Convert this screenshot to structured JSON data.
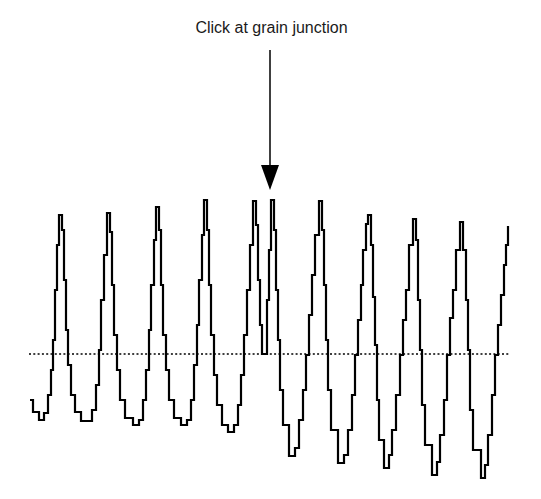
{
  "annotation": {
    "label": "Click at grain junction",
    "arrow": {
      "x": 270,
      "y_start": 50,
      "y_end": 190,
      "head_top": 165
    }
  },
  "colors": {
    "trace": "#000000",
    "baseline": "#000000",
    "text": "#1a1a1a"
  },
  "chart_data": {
    "type": "line",
    "title": "",
    "xlabel": "",
    "ylabel": "",
    "grid": false,
    "annotations": [
      {
        "text": "Click at grain junction",
        "x_pixel": 270,
        "points_to": "grain junction between peaks 5 and 6"
      }
    ],
    "baseline": {
      "style": "dotted",
      "y_pixel": 354,
      "x_start": 29,
      "x_end": 510
    },
    "peaks_pixel": [
      [
        59,
        215
      ],
      [
        107,
        213
      ],
      [
        156,
        207
      ],
      [
        204,
        200
      ],
      [
        253,
        201
      ],
      [
        271,
        200
      ],
      [
        319,
        201
      ],
      [
        368,
        215
      ],
      [
        413,
        219
      ],
      [
        460,
        222
      ]
    ],
    "troughs_pixel": [
      [
        39,
        420
      ],
      [
        87,
        421
      ],
      [
        133,
        425
      ],
      [
        181,
        425
      ],
      [
        228,
        432
      ],
      [
        262,
        354
      ],
      [
        289,
        456
      ],
      [
        338,
        463
      ],
      [
        384,
        468
      ],
      [
        432,
        475
      ],
      [
        481,
        478
      ]
    ],
    "start_pixel": [
      30,
      400
    ],
    "end_pixel": [
      508,
      226
    ],
    "series": [
      {
        "name": "signal",
        "points": [
          [
            30,
            400
          ],
          [
            33,
            412
          ],
          [
            39,
            420
          ],
          [
            44,
            413
          ],
          [
            48,
            395
          ],
          [
            51,
            370
          ],
          [
            53,
            340
          ],
          [
            55,
            290
          ],
          [
            57,
            245
          ],
          [
            59,
            215
          ],
          [
            62,
            230
          ],
          [
            64,
            280
          ],
          [
            66,
            330
          ],
          [
            68,
            365
          ],
          [
            71,
            395
          ],
          [
            75,
            412
          ],
          [
            81,
            421
          ],
          [
            87,
            421
          ],
          [
            92,
            410
          ],
          [
            96,
            385
          ],
          [
            99,
            350
          ],
          [
            101,
            300
          ],
          [
            104,
            255
          ],
          [
            107,
            213
          ],
          [
            110,
            232
          ],
          [
            112,
            285
          ],
          [
            114,
            335
          ],
          [
            117,
            370
          ],
          [
            120,
            400
          ],
          [
            125,
            418
          ],
          [
            133,
            425
          ],
          [
            139,
            420
          ],
          [
            143,
            400
          ],
          [
            146,
            370
          ],
          [
            149,
            330
          ],
          [
            151,
            285
          ],
          [
            154,
            240
          ],
          [
            156,
            207
          ],
          [
            159,
            230
          ],
          [
            161,
            285
          ],
          [
            163,
            335
          ],
          [
            166,
            370
          ],
          [
            169,
            400
          ],
          [
            174,
            418
          ],
          [
            181,
            425
          ],
          [
            187,
            420
          ],
          [
            191,
            400
          ],
          [
            194,
            365
          ],
          [
            197,
            325
          ],
          [
            199,
            280
          ],
          [
            202,
            235
          ],
          [
            204,
            200
          ],
          [
            207,
            230
          ],
          [
            209,
            285
          ],
          [
            211,
            335
          ],
          [
            214,
            375
          ],
          [
            217,
            405
          ],
          [
            222,
            425
          ],
          [
            228,
            432
          ],
          [
            234,
            425
          ],
          [
            238,
            405
          ],
          [
            241,
            375
          ],
          [
            244,
            335
          ],
          [
            247,
            290
          ],
          [
            250,
            245
          ],
          [
            253,
            201
          ],
          [
            256,
            225
          ],
          [
            258,
            280
          ],
          [
            260,
            325
          ],
          [
            262,
            354
          ],
          [
            266,
            354
          ],
          [
            267,
            300
          ],
          [
            269,
            250
          ],
          [
            271,
            200
          ],
          [
            274,
            230
          ],
          [
            276,
            290
          ],
          [
            278,
            340
          ],
          [
            280,
            390
          ],
          [
            283,
            425
          ],
          [
            289,
            456
          ],
          [
            295,
            448
          ],
          [
            299,
            420
          ],
          [
            303,
            390
          ],
          [
            306,
            355
          ],
          [
            309,
            315
          ],
          [
            312,
            275
          ],
          [
            315,
            235
          ],
          [
            319,
            201
          ],
          [
            322,
            230
          ],
          [
            324,
            285
          ],
          [
            326,
            340
          ],
          [
            328,
            390
          ],
          [
            331,
            430
          ],
          [
            338,
            463
          ],
          [
            344,
            455
          ],
          [
            348,
            430
          ],
          [
            352,
            395
          ],
          [
            355,
            355
          ],
          [
            358,
            320
          ],
          [
            361,
            285
          ],
          [
            363,
            250
          ],
          [
            366,
            224
          ],
          [
            368,
            215
          ],
          [
            371,
            245
          ],
          [
            373,
            297
          ],
          [
            375,
            345
          ],
          [
            377,
            400
          ],
          [
            379,
            440
          ],
          [
            384,
            468
          ],
          [
            389,
            455
          ],
          [
            392,
            430
          ],
          [
            396,
            395
          ],
          [
            400,
            355
          ],
          [
            403,
            320
          ],
          [
            406,
            290
          ],
          [
            409,
            245
          ],
          [
            413,
            219
          ],
          [
            416,
            240
          ],
          [
            418,
            300
          ],
          [
            420,
            350
          ],
          [
            422,
            405
          ],
          [
            425,
            445
          ],
          [
            432,
            475
          ],
          [
            437,
            462
          ],
          [
            440,
            435
          ],
          [
            444,
            400
          ],
          [
            447,
            355
          ],
          [
            450,
            318
          ],
          [
            453,
            290
          ],
          [
            456,
            250
          ],
          [
            460,
            222
          ],
          [
            463,
            250
          ],
          [
            466,
            300
          ],
          [
            468,
            350
          ],
          [
            470,
            410
          ],
          [
            473,
            450
          ],
          [
            481,
            478
          ],
          [
            485,
            465
          ],
          [
            488,
            435
          ],
          [
            492,
            395
          ],
          [
            495,
            355
          ],
          [
            498,
            325
          ],
          [
            501,
            295
          ],
          [
            504,
            265
          ],
          [
            506,
            245
          ],
          [
            508,
            226
          ]
        ]
      }
    ]
  }
}
